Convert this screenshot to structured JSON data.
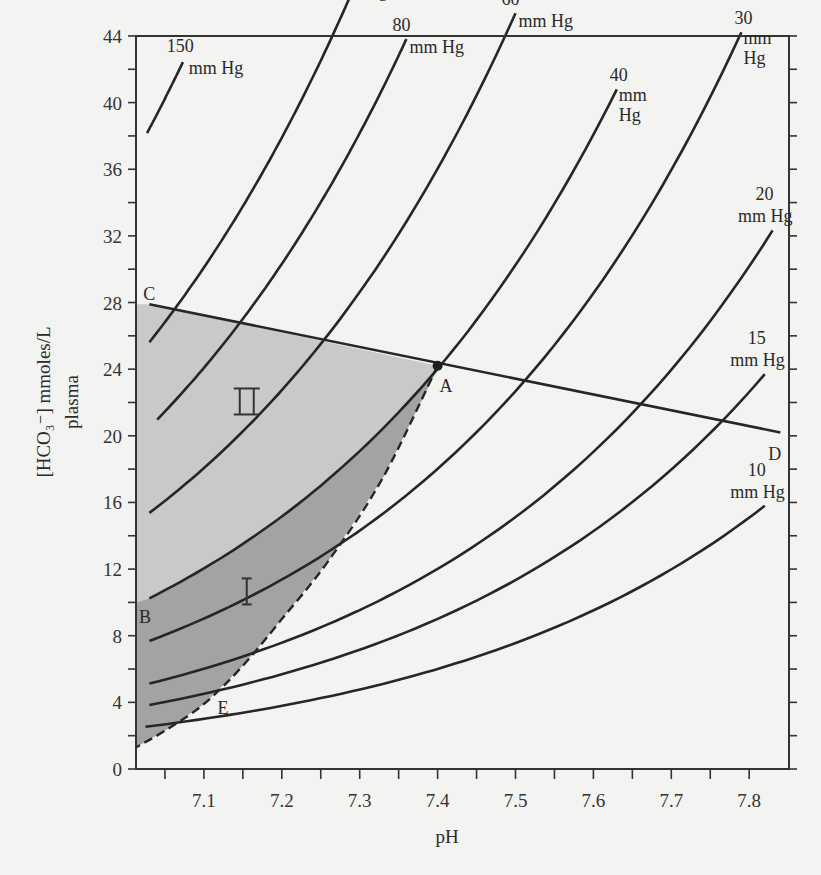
{
  "chart_data": {
    "type": "line",
    "title": "",
    "xlabel": "pH",
    "ylabel": "[HCO3-] mmoles/L plasma",
    "ylabel_line1": "[HCO₃⁻] mmoles/L",
    "ylabel_line2": "plasma",
    "xlim": [
      7.013,
      7.85
    ],
    "ylim": [
      0,
      44
    ],
    "grid": false,
    "x_ticks": [
      7.1,
      7.2,
      7.3,
      7.4,
      7.5,
      7.6,
      7.7,
      7.8
    ],
    "x_tick_labels": [
      "7.1",
      "7.2",
      "7.3",
      "7.4",
      "7.5",
      "7.6",
      "7.7",
      "7.8"
    ],
    "x_minor_ticks": [
      7.05,
      7.15,
      7.25,
      7.35,
      7.45,
      7.55,
      7.65,
      7.75
    ],
    "y_ticks": [
      0,
      4,
      8,
      12,
      16,
      20,
      24,
      28,
      32,
      36,
      40,
      44
    ],
    "y_tick_labels": [
      "0",
      "4",
      "8",
      "12",
      "16",
      "20",
      "24",
      "28",
      "32",
      "36",
      "40",
      "44"
    ],
    "y_minor_ticks": [
      2,
      6,
      10,
      14,
      18,
      22,
      26,
      30,
      34,
      38,
      42
    ],
    "isobar_equation": "HCO3 = 0.0301 * PCO2 * 10^(pH - 6.1)",
    "series": [
      {
        "name": "150 mm Hg",
        "pco2": 150,
        "ph_range": [
          7.027,
          7.073
        ],
        "label_line1": "150",
        "label_line2": "mm Hg",
        "label_layout": "split-left"
      },
      {
        "name": "100 mm Hg",
        "pco2": 100,
        "ph_range": [
          7.03,
          7.305
        ],
        "label_line1": "100",
        "label_line2": "mm",
        "label_line3": "Hg",
        "label_layout": "stack"
      },
      {
        "name": "80 mm Hg",
        "pco2": 80,
        "ph_range": [
          7.04,
          7.36
        ],
        "label_line1": "80",
        "label_line2": "mm Hg",
        "label_layout": "split"
      },
      {
        "name": "60 mm Hg",
        "pco2": 60,
        "ph_range": [
          7.03,
          7.5
        ],
        "label_line1": "60",
        "label_line2": "mm Hg",
        "label_layout": "split"
      },
      {
        "name": "40 mm Hg",
        "pco2": 40,
        "ph_range": [
          7.03,
          7.63
        ],
        "label_line1": "40",
        "label_line2": "mm",
        "label_line3": "Hg",
        "label_layout": "stack"
      },
      {
        "name": "30 mm Hg",
        "pco2": 30,
        "ph_range": [
          7.03,
          7.79
        ],
        "label_line1": "30",
        "label_line2": "mm",
        "label_line3": "Hg",
        "label_layout": "stack"
      },
      {
        "name": "20 mm Hg",
        "pco2": 20,
        "ph_range": [
          7.03,
          7.83
        ],
        "label_line1": "20",
        "label_line2": "mm Hg",
        "label_layout": "above"
      },
      {
        "name": "15 mm Hg",
        "pco2": 15,
        "ph_range": [
          7.03,
          7.82
        ],
        "label_line1": "15",
        "label_line2": "mm Hg",
        "label_layout": "above"
      },
      {
        "name": "10 mm Hg",
        "pco2": 10,
        "ph_range": [
          7.025,
          7.82
        ],
        "label_line1": "10",
        "label_line2": "mm Hg",
        "label_layout": "above"
      }
    ],
    "buffer_line_CD": {
      "points": [
        [
          7.03,
          27.9
        ],
        [
          7.84,
          20.2
        ]
      ],
      "labels": [
        "C",
        "D"
      ]
    },
    "points": [
      {
        "label": "A",
        "ph": 7.4,
        "hco3": 24.2
      },
      {
        "label": "B",
        "ph": 7.02,
        "hco3": 10.0
      },
      {
        "label": "C",
        "ph": 7.03,
        "hco3": 27.9
      },
      {
        "label": "D",
        "ph": 7.84,
        "hco3": 20.2
      },
      {
        "label": "E",
        "ph": 7.12,
        "hco3": 4.0
      }
    ],
    "dashed_curve_AE": {
      "points": [
        [
          7.4,
          24.2
        ],
        [
          7.33,
          17.5
        ],
        [
          7.26,
          12.5
        ],
        [
          7.2,
          9.0
        ],
        [
          7.15,
          6.2
        ],
        [
          7.1,
          3.9
        ],
        [
          7.05,
          2.3
        ],
        [
          7.013,
          1.3
        ]
      ]
    },
    "regions": [
      {
        "label": "II",
        "description": "light shaded region bounded by line C-A, 40 mm Hg isobar, and pH axis",
        "color": "#c9c9c7",
        "label_pos": [
          7.155,
          22.0
        ]
      },
      {
        "label": "I",
        "description": "dark shaded region between 40 mm Hg isobar (B to A) and dashed curve A-E",
        "color": "#a3a3a1",
        "label_pos": [
          7.155,
          10.6
        ]
      }
    ],
    "annotations": [
      "A",
      "B",
      "C",
      "D",
      "E",
      "I",
      "II"
    ]
  },
  "colors": {
    "background": "#f3f3f1",
    "line": "#262626",
    "region_I": "#a3a3a1",
    "region_II": "#c9c9c7"
  }
}
